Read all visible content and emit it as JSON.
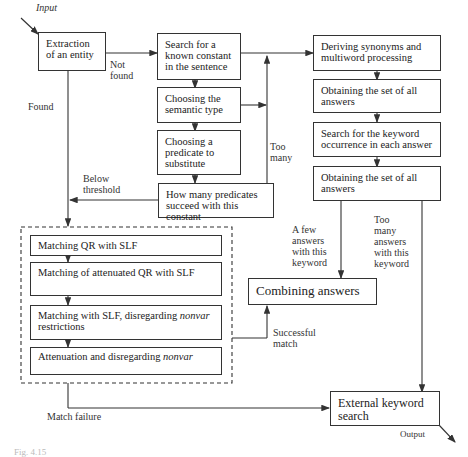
{
  "labels": {
    "input": "Input",
    "output": "Output",
    "not_found": "Not\nfound",
    "found": "Found",
    "below_threshold": "Below\nthreshold",
    "too_many": "Too\nmany",
    "a_few": "A few\nanswers\nwith this\nkeyword",
    "too_many_answers": "Too\nmany\nanswers\nwith this\nkeyword",
    "successful_match": "Successful\nmatch",
    "match_failure": "Match failure"
  },
  "boxes": {
    "extraction": "Extraction of an entity",
    "search_constant": "Search for a known constant in the sentence",
    "semantic_type": "Choosing the semantic type",
    "predicate": "Choosing a predicate to substitute",
    "how_many": "How many predicates succeed with this constant",
    "synonyms": "Deriving synonyms and multiword processing",
    "answers1": "Obtaining the set of all answers",
    "keyword_search": "Search for the keyword occurrence in each answer",
    "answers2": "Obtaining the set of all answers",
    "match_qr": "Matching QR with SLF",
    "match_att": "Matching of attenuated QR with SLF",
    "match_nonvar_a": "Matching with SLF, disregarding ",
    "match_nonvar_em": "nonvar",
    "match_nonvar_b": " restrictions",
    "att_nonvar_a": "Attenuation and disregarding ",
    "att_nonvar_em": "nonvar",
    "combining": "Combining answers",
    "external": "External keyword search"
  },
  "caption": "Fig. 4.15"
}
